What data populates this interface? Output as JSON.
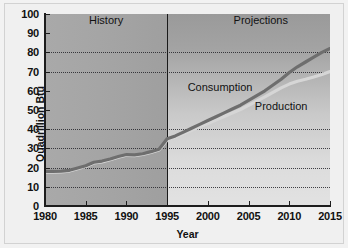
{
  "chart_data": {
    "type": "line",
    "title": "",
    "xlabel": "Year",
    "ylabel": "Quadrillion Btu",
    "xlim": [
      1980,
      2015
    ],
    "ylim": [
      0,
      100
    ],
    "xticks": [
      1980,
      1985,
      1990,
      1995,
      2000,
      2005,
      2010,
      2015
    ],
    "yticks": [
      0,
      10,
      20,
      30,
      40,
      50,
      60,
      70,
      80,
      90,
      100
    ],
    "gridlines_y": [
      10,
      20,
      30,
      40,
      70,
      80
    ],
    "grid": "horizontal-dotted",
    "legend": "inline-annotations",
    "regions": [
      {
        "name": "History",
        "x_start": 1980,
        "x_end": 1995,
        "shade": "#a4a4a4"
      },
      {
        "name": "Projections",
        "x_start": 1995,
        "x_end": 2015,
        "shade": "#c9c9c9"
      }
    ],
    "divider_x": 1995,
    "annotations": [
      {
        "text": "History",
        "x": 1987.5,
        "y": 97
      },
      {
        "text": "Projections",
        "x": 2006.5,
        "y": 97
      },
      {
        "text": "Consumption",
        "x": 2001.5,
        "y": 62
      },
      {
        "text": "Production",
        "x": 2009.0,
        "y": 52
      }
    ],
    "series": [
      {
        "name": "Consumption",
        "color": "#6e6e6e",
        "x": [
          1980,
          1981,
          1982,
          1983,
          1984,
          1985,
          1986,
          1987,
          1988,
          1989,
          1990,
          1991,
          1992,
          1993,
          1994,
          1995,
          1996,
          1997,
          1998,
          1999,
          2000,
          2001,
          2002,
          2003,
          2004,
          2005,
          2006,
          2007,
          2008,
          2009,
          2010,
          2011,
          2012,
          2013,
          2014,
          2015
        ],
        "y": [
          18.0,
          18.0,
          18.2,
          18.6,
          19.8,
          21.0,
          22.8,
          23.4,
          24.5,
          25.8,
          26.8,
          26.6,
          27.2,
          28.3,
          29.6,
          35.0,
          36.5,
          38.5,
          40.5,
          42.5,
          44.5,
          46.5,
          48.5,
          50.5,
          52.5,
          55.0,
          57.5,
          60.0,
          63.0,
          66.0,
          69.5,
          72.5,
          75.0,
          77.5,
          80.0,
          82.0
        ]
      },
      {
        "name": "Production",
        "color": "#d6d6d6",
        "x": [
          1980,
          1981,
          1982,
          1983,
          1984,
          1985,
          1986,
          1987,
          1988,
          1989,
          1990,
          1991,
          1992,
          1993,
          1994,
          1995,
          1996,
          1997,
          1998,
          1999,
          2000,
          2001,
          2002,
          2003,
          2004,
          2005,
          2006,
          2007,
          2008,
          2009,
          2010,
          2011,
          2012,
          2013,
          2014,
          2015
        ],
        "y": [
          17.6,
          17.6,
          17.8,
          18.2,
          19.4,
          20.6,
          22.4,
          23.0,
          24.1,
          25.4,
          26.4,
          26.2,
          26.8,
          27.9,
          29.2,
          34.4,
          35.8,
          37.6,
          39.4,
          41.2,
          43.0,
          44.8,
          46.6,
          48.4,
          50.2,
          52.4,
          54.6,
          56.8,
          59.2,
          61.5,
          63.5,
          65.0,
          66.0,
          67.2,
          68.5,
          70.0
        ]
      }
    ]
  }
}
